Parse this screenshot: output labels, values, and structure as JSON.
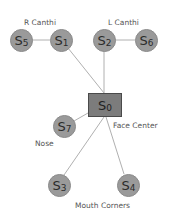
{
  "diagram": {
    "title": "",
    "nodes": [
      {
        "id": "S0",
        "letter": "S",
        "sub": "0",
        "shape": "square",
        "x": 105,
        "y": 105,
        "w": 34,
        "h": 24
      },
      {
        "id": "S1",
        "letter": "S",
        "sub": "1",
        "shape": "circle",
        "x": 61,
        "y": 40,
        "r": 11
      },
      {
        "id": "S2",
        "letter": "S",
        "sub": "2",
        "shape": "circle",
        "x": 104,
        "y": 40,
        "r": 11
      },
      {
        "id": "S3",
        "letter": "S",
        "sub": "3",
        "shape": "circle",
        "x": 59,
        "y": 185,
        "r": 11
      },
      {
        "id": "S4",
        "letter": "S",
        "sub": "4",
        "shape": "circle",
        "x": 128,
        "y": 185,
        "r": 11
      },
      {
        "id": "S5",
        "letter": "S",
        "sub": "5",
        "shape": "circle",
        "x": 21,
        "y": 40,
        "r": 11
      },
      {
        "id": "S6",
        "letter": "S",
        "sub": "6",
        "shape": "circle",
        "x": 146,
        "y": 40,
        "r": 11
      },
      {
        "id": "S7",
        "letter": "S",
        "sub": "7",
        "shape": "circle",
        "x": 64,
        "y": 126,
        "r": 11
      }
    ],
    "edges": [
      {
        "from": "S5",
        "to": "S1"
      },
      {
        "from": "S2",
        "to": "S6"
      },
      {
        "from": "S1",
        "to": "S0"
      },
      {
        "from": "S2",
        "to": "S0"
      },
      {
        "from": "S7",
        "to": "S0"
      },
      {
        "from": "S3",
        "to": "S0"
      },
      {
        "from": "S4",
        "to": "S0"
      }
    ],
    "labels": {
      "r_canthi": "R Canthi",
      "l_canthi": "L Canthi",
      "face_center": "Face Center",
      "nose": "Nose",
      "mouth_corners": "Mouth Corners"
    },
    "colors": {
      "node_fill": "#9a9a9a",
      "center_fill": "#7c7c7c",
      "center_border": "#4a4a4a",
      "edge": "#b0b0b0",
      "label_text": "#555555"
    }
  }
}
